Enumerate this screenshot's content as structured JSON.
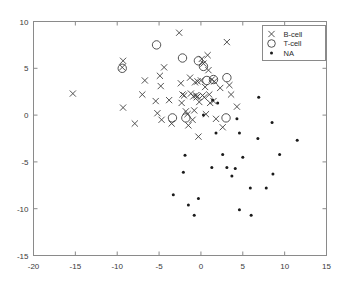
{
  "chart_data": {
    "type": "scatter",
    "title": "",
    "xlabel": "",
    "ylabel": "",
    "xlim": [
      -20,
      15
    ],
    "ylim": [
      -15,
      10
    ],
    "xticks": [
      -20,
      -15,
      -10,
      -5,
      0,
      5,
      10,
      15
    ],
    "yticks": [
      -15,
      -10,
      -5,
      0,
      5,
      10
    ],
    "xtick_labels": [
      "-20",
      "-15",
      "-10",
      "-5",
      "0",
      "5",
      "10",
      "15"
    ],
    "ytick_labels": [
      "-15",
      "-10",
      "-5",
      "0",
      "5",
      "10"
    ],
    "grid": false,
    "legend_position": "top-right",
    "legend": [
      {
        "label": "B-cell",
        "marker": "x-marker-icon"
      },
      {
        "label": "T-cell",
        "marker": "circle-marker-icon"
      },
      {
        "label": "NA",
        "marker": "dot-marker-icon"
      }
    ],
    "series": [
      {
        "name": "B-cell",
        "marker": "x",
        "points": [
          [
            -15.3,
            2.3
          ],
          [
            -9.3,
            5.8
          ],
          [
            -9.4,
            5.1
          ],
          [
            -9.3,
            0.8
          ],
          [
            -7.9,
            -0.9
          ],
          [
            -7.0,
            2.2
          ],
          [
            -6.7,
            3.7
          ],
          [
            -5.4,
            1.5
          ],
          [
            -5.2,
            0.2
          ],
          [
            -4.9,
            4.2
          ],
          [
            -4.8,
            3.1
          ],
          [
            -4.7,
            -0.5
          ],
          [
            -4.4,
            5.1
          ],
          [
            -3.8,
            1.6
          ],
          [
            -3.5,
            -0.9
          ],
          [
            -2.6,
            8.8
          ],
          [
            -2.4,
            3.4
          ],
          [
            -2.3,
            1.3
          ],
          [
            -2.2,
            2.2
          ],
          [
            -2.0,
            2.1
          ],
          [
            -1.8,
            0.4
          ],
          [
            -1.6,
            0.1
          ],
          [
            -1.5,
            -1.1
          ],
          [
            -1.3,
            4.0
          ],
          [
            -1.2,
            2.3
          ],
          [
            -1.0,
            -0.5
          ],
          [
            -0.9,
            2.0
          ],
          [
            -0.8,
            0.5
          ],
          [
            -0.7,
            3.5
          ],
          [
            -0.6,
            2.1
          ],
          [
            -0.5,
            1.9
          ],
          [
            -0.4,
            3.6
          ],
          [
            -0.4,
            2.0
          ],
          [
            -0.3,
            -2.3
          ],
          [
            -0.2,
            1.4
          ],
          [
            0.0,
            3.7
          ],
          [
            0.1,
            6.0
          ],
          [
            0.2,
            2.1
          ],
          [
            0.3,
            5.5
          ],
          [
            0.4,
            1.9
          ],
          [
            0.5,
            3.0
          ],
          [
            0.6,
            0.1
          ],
          [
            0.8,
            6.4
          ],
          [
            0.9,
            4.8
          ],
          [
            1.0,
            2.2
          ],
          [
            1.1,
            1.3
          ],
          [
            1.3,
            3.8
          ],
          [
            1.5,
            1.5
          ],
          [
            1.6,
            3.6
          ],
          [
            1.8,
            -0.4
          ],
          [
            2.3,
            2.9
          ],
          [
            2.6,
            -1.3
          ],
          [
            3.1,
            7.8
          ],
          [
            3.4,
            3.2
          ],
          [
            3.6,
            2.2
          ],
          [
            4.3,
            0.9
          ]
        ]
      },
      {
        "name": "T-cell",
        "marker": "o",
        "points": [
          [
            -9.4,
            5.0
          ],
          [
            -5.3,
            7.5
          ],
          [
            -3.4,
            -0.3
          ],
          [
            -2.2,
            6.1
          ],
          [
            -1.8,
            -0.3
          ],
          [
            -0.3,
            5.8
          ],
          [
            0.3,
            5.2
          ],
          [
            0.7,
            3.7
          ],
          [
            1.5,
            3.8
          ],
          [
            3.0,
            -0.3
          ],
          [
            3.1,
            4.0
          ]
        ]
      },
      {
        "name": "NA",
        "marker": ".",
        "points": [
          [
            0.3,
            0.0
          ],
          [
            1.8,
            -1.9
          ],
          [
            2.6,
            -4.2
          ],
          [
            3.1,
            -5.6
          ],
          [
            3.7,
            -6.5
          ],
          [
            4.1,
            -5.7
          ],
          [
            4.3,
            -0.4
          ],
          [
            4.6,
            -1.9
          ],
          [
            4.6,
            -10.1
          ],
          [
            5.0,
            -4.5
          ],
          [
            5.9,
            -7.8
          ],
          [
            6.0,
            -10.7
          ],
          [
            6.8,
            -2.5
          ],
          [
            6.9,
            1.9
          ],
          [
            7.8,
            -7.8
          ],
          [
            8.5,
            -0.8
          ],
          [
            8.6,
            -6.3
          ],
          [
            9.4,
            -4.2
          ],
          [
            11.5,
            -2.7
          ],
          [
            -0.3,
            -8.9
          ],
          [
            -0.8,
            -10.7
          ],
          [
            -1.5,
            -9.6
          ],
          [
            -1.9,
            -4.3
          ],
          [
            -2.1,
            -6.1
          ],
          [
            -3.3,
            -8.5
          ],
          [
            1.3,
            -5.6
          ],
          [
            1.4,
            1.6
          ],
          [
            2.0,
            1.3
          ]
        ]
      }
    ]
  }
}
